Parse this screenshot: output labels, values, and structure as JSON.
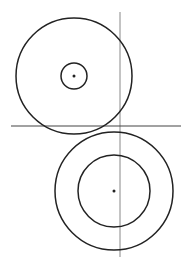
{
  "diagram": {
    "background": "#ffffff",
    "stroke_color": "#222222",
    "line_color": "#888888",
    "top_group": {
      "center": [
        74,
        76
      ],
      "outer_radius": 58,
      "inner_radius": 13,
      "dot_radius": 1.5
    },
    "bottom_group": {
      "center": [
        114,
        191
      ],
      "outer_radius": 59,
      "inner_radius": 36,
      "dot_radius": 1.5
    },
    "vertical_line": {
      "x": 120,
      "y1": 12,
      "y2": 257
    },
    "horizontal_line": {
      "y": 126,
      "x1": 11,
      "x2": 181
    }
  }
}
